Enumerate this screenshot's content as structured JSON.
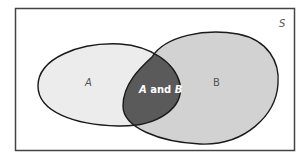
{
  "diagram": {
    "type": "venn",
    "universe": {
      "label": "S"
    },
    "sets": [
      {
        "id": "A",
        "label": "A",
        "fill": "#ececec"
      },
      {
        "id": "B",
        "label": "B",
        "fill": "#d2d2d2"
      }
    ],
    "intersection": {
      "label_left": "A",
      "label_mid": " and ",
      "label_right": "B",
      "fill": "#5a5a5a"
    },
    "stroke_color": "#1a1a1a",
    "border_color": "#444444"
  }
}
